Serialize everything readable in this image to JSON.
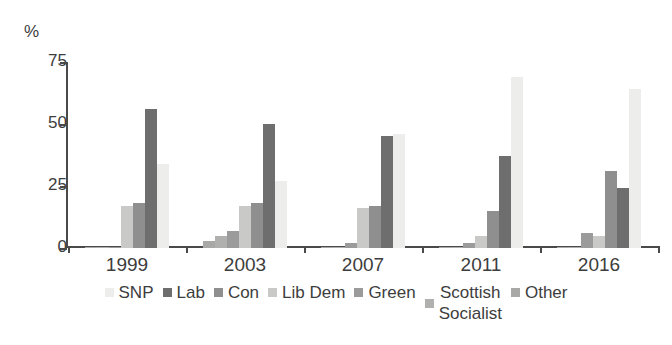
{
  "chart_data": {
    "type": "bar",
    "title": "",
    "subtitle": "",
    "xlabel": "",
    "ylabel": "%",
    "ylim": [
      0,
      75
    ],
    "yticks": [
      0,
      25,
      50,
      75
    ],
    "grid": false,
    "legend_position": "bottom",
    "categories": [
      "1999",
      "2003",
      "2007",
      "2011",
      "2016"
    ],
    "series": [
      {
        "name": "SNP",
        "color": "#ededeb",
        "values": [
          34,
          27,
          46,
          69,
          64
        ]
      },
      {
        "name": "Lab",
        "color": "#6e6e6e",
        "values": [
          56,
          50,
          45,
          37,
          24
        ]
      },
      {
        "name": "Con",
        "color": "#8f8f8f",
        "values": [
          18,
          18,
          17,
          15,
          31
        ]
      },
      {
        "name": "Lib Dem",
        "color": "#c9c9c7",
        "values": [
          17,
          17,
          16,
          5,
          5
        ]
      },
      {
        "name": "Green",
        "color": "#9b9b9b",
        "values": [
          0.5,
          7,
          2,
          2,
          6
        ]
      },
      {
        "name": "Scottish Socialist",
        "color": "#b0b0ae",
        "values": [
          0.5,
          5,
          0.5,
          0.5,
          0.5
        ]
      },
      {
        "name": "Other",
        "color": "#a8a8a6",
        "values": [
          0.5,
          3,
          0.5,
          0.5,
          0.5
        ]
      }
    ],
    "plot_order": [
      "Other",
      "Scottish Socialist",
      "Green",
      "Lib Dem",
      "Con",
      "Lab",
      "SNP"
    ]
  },
  "axis": {
    "y_unit": "%",
    "tick_labels": [
      "75",
      "50",
      "25",
      "0"
    ]
  },
  "legend": {
    "items": [
      {
        "label": "SNP"
      },
      {
        "label": "Lab"
      },
      {
        "label": "Con"
      },
      {
        "label": "Lib Dem"
      },
      {
        "label": "Green"
      },
      {
        "label": "Scottish\nSocialist"
      },
      {
        "label": "Other"
      }
    ]
  }
}
